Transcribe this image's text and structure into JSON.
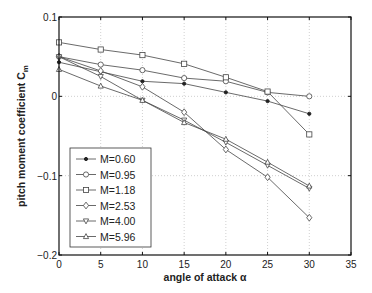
{
  "chart_data": {
    "type": "line",
    "title": "",
    "xlabel": "angle of attack α",
    "ylabel": "pitch moment coefficient C",
    "ylabel_sub": "m",
    "xlim": [
      0,
      35
    ],
    "ylim": [
      -0.2,
      0.1
    ],
    "xticks": [
      0,
      5,
      10,
      15,
      20,
      25,
      30,
      35
    ],
    "xtick_labels": [
      "0",
      "5",
      "10",
      "15",
      "20",
      "25",
      "30",
      "35"
    ],
    "yticks": [
      -0.2,
      -0.1,
      0,
      0.1
    ],
    "ytick_labels": [
      "−0.2",
      "−0.1",
      "0",
      "0.1"
    ],
    "grid": true,
    "legend_position": "lower left",
    "x": [
      0,
      5,
      10,
      15,
      20,
      25,
      30
    ],
    "series": [
      {
        "name": "M=0.60",
        "marker": "dot",
        "values": [
          0.043,
          0.031,
          0.019,
          0.016,
          0.005,
          -0.006,
          -0.022
        ]
      },
      {
        "name": "M=0.95",
        "marker": "circle",
        "values": [
          0.05,
          0.04,
          0.033,
          0.023,
          0.019,
          0.005,
          0.0
        ]
      },
      {
        "name": "M=1.18",
        "marker": "square",
        "values": [
          0.068,
          0.059,
          0.052,
          0.041,
          0.024,
          0.006,
          -0.048
        ]
      },
      {
        "name": "M=2.53",
        "marker": "diamond",
        "values": [
          0.05,
          0.032,
          0.012,
          -0.02,
          -0.067,
          -0.102,
          -0.153
        ]
      },
      {
        "name": "M=4.00",
        "marker": "triangle-down",
        "values": [
          0.05,
          0.025,
          -0.005,
          -0.03,
          -0.058,
          -0.087,
          -0.116
        ]
      },
      {
        "name": "M=5.96",
        "marker": "triangle-up",
        "values": [
          0.034,
          0.013,
          -0.005,
          -0.033,
          -0.054,
          -0.083,
          -0.113
        ]
      }
    ]
  },
  "colors": {
    "line": "#444444",
    "axis": "#111111",
    "grid": "#bbbbbb"
  }
}
